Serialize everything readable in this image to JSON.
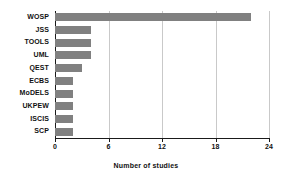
{
  "chart_data": {
    "type": "bar",
    "orientation": "horizontal",
    "title": "",
    "xlabel": "Number of studies",
    "ylabel": "",
    "categories": [
      "WOSP",
      "JSS",
      "TOOLS",
      "UML",
      "QEST",
      "ECBS",
      "MoDELS",
      "UKPEW",
      "ISCIS",
      "SCP"
    ],
    "values": [
      22,
      4,
      4,
      4,
      3,
      2,
      2,
      2,
      2,
      2
    ],
    "xlim": [
      0,
      24
    ],
    "xticks": [
      0,
      6,
      12,
      18,
      24
    ],
    "xticklabels": [
      "0",
      "6",
      "12",
      "18",
      "24"
    ],
    "grid": "vertical",
    "legend": "none",
    "bar_color": "#808080",
    "gridline_color": "#c9c9c9",
    "axis_color": "#1a1a1a",
    "background": "#ffffff"
  }
}
